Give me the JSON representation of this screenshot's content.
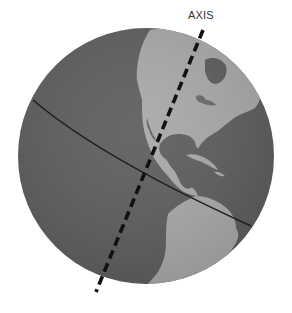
{
  "diagram": {
    "labels": {
      "axis": "AXIS"
    },
    "elements": {
      "globe": {
        "center": [
          146,
          156
        ],
        "radius": 128
      },
      "equator": {
        "start": [
          33,
          100
        ],
        "end": [
          251,
          226
        ]
      },
      "axis_line": {
        "start": [
          203,
          30
        ],
        "end": [
          96,
          292
        ],
        "style": "dashed"
      }
    },
    "colors": {
      "background": "#ffffff",
      "ocean": "#5e5e5e",
      "land": "#a9a9a9",
      "equator_line": "#1e1e1e",
      "axis_line": "#111111",
      "label_text": "#333333"
    },
    "regions_shown": [
      "North America",
      "Central America",
      "Caribbean",
      "South America (northern part)",
      "Pacific Ocean",
      "Atlantic Ocean"
    ]
  }
}
